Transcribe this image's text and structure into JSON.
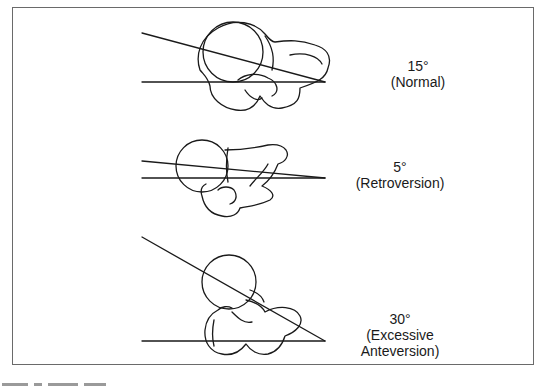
{
  "figure": {
    "panels": [
      {
        "id": "normal",
        "angle": "15°",
        "description": "(Normal)"
      },
      {
        "id": "retroversion",
        "angle": "5°",
        "description": "(Retroversion)"
      },
      {
        "id": "excessive-anteversion",
        "angle": "30°",
        "description_line1": "(Excessive",
        "description_line2": "Anteversion)"
      }
    ],
    "colors": {
      "line": "#1a1a1a",
      "border": "#6a6a6a",
      "background": "#ffffff"
    }
  }
}
